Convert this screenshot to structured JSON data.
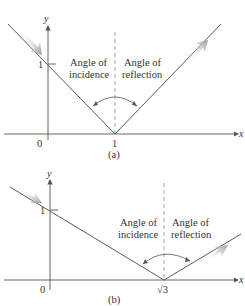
{
  "colors": {
    "line": "#5a5a5a",
    "axis": "#555555",
    "dashed": "#9a9a9a",
    "arrow": "#b0b0b0",
    "text": "#333333"
  },
  "figure_a": {
    "caption": "(a)",
    "x_axis_label": "x",
    "y_axis_label": "y",
    "origin_label": "0",
    "y_tick_label": "1",
    "x_tick_label": "1",
    "incidence_label_line1": "Angle of",
    "incidence_label_line2": "incidence",
    "reflection_label_line1": "Angle of",
    "reflection_label_line2": "reflection"
  },
  "figure_b": {
    "caption": "(b)",
    "x_axis_label": "x",
    "y_axis_label": "y",
    "origin_label": "0",
    "y_tick_label": "1",
    "x_tick_label": "√3",
    "incidence_label_line1": "Angle of",
    "incidence_label_line2": "incidence",
    "reflection_label_line1": "Angle of",
    "reflection_label_line2": "reflection"
  }
}
